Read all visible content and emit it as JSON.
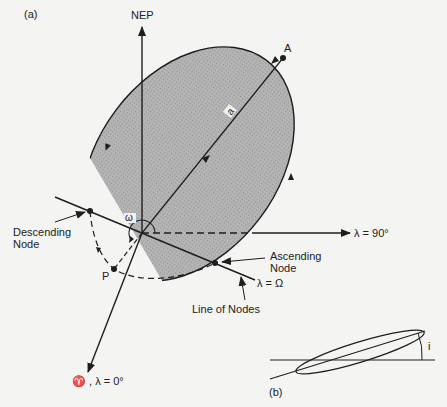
{
  "figure": {
    "panel_a_label": "(a)",
    "panel_b_label": "(b)",
    "axes": {
      "nep": "NEP",
      "lambda_90": "λ = 90°",
      "vernal": "♈ , λ = 0°",
      "lambda_omega": "λ = Ω"
    },
    "points": {
      "apoapsis": "A",
      "periapsis": "P",
      "semi_major": "a"
    },
    "annotations": {
      "descending_node_line1": "Descending",
      "descending_node_line2": "Node",
      "ascending_node_line1": "Ascending",
      "ascending_node_line2": "Node",
      "line_of_nodes": "Line of Nodes",
      "arg_periapsis": "ω",
      "inclination": "i"
    },
    "colors": {
      "orbit_fill": "#a9a9a9",
      "line": "#1e1e1e",
      "background": "#f4f4f2"
    }
  }
}
